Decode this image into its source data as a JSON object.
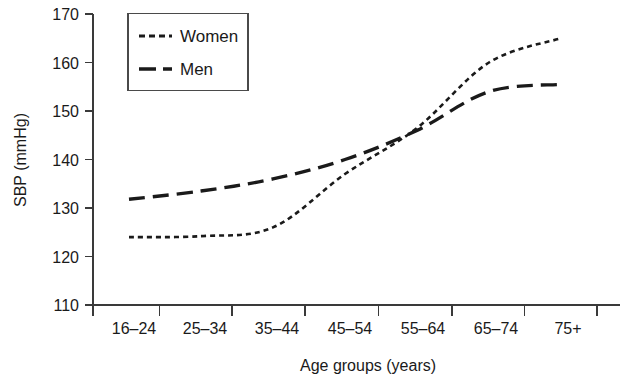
{
  "chart_data": {
    "type": "line",
    "title": "",
    "xlabel": "Age groups (years)",
    "ylabel": "SBP (mmHg)",
    "categories": [
      "16–24",
      "25–34",
      "35–44",
      "45–54",
      "55–64",
      "65–74",
      "75+"
    ],
    "ylim": [
      110,
      170
    ],
    "yticks": [
      110,
      120,
      130,
      140,
      150,
      160,
      170
    ],
    "ytick_labels": [
      "110",
      "120",
      "130",
      "140",
      "150",
      "160",
      "170"
    ],
    "grid": false,
    "legend_position": "top-left-inside",
    "series": [
      {
        "name": "Women",
        "line_style": "dotted",
        "color": "#1a1a1a",
        "values": [
          124.0,
          124.2,
          126.0,
          137.0,
          146.5,
          160.0,
          165.0
        ]
      },
      {
        "name": "Men",
        "line_style": "dashed",
        "color": "#1a1a1a",
        "values": [
          131.8,
          133.5,
          136.0,
          140.0,
          146.0,
          154.0,
          155.5
        ]
      }
    ]
  },
  "legend": {
    "entries": [
      {
        "label": "Women"
      },
      {
        "label": "Men"
      }
    ]
  },
  "axes": {
    "y_title": "SBP (mmHg)",
    "x_title": "Age groups (years)"
  }
}
